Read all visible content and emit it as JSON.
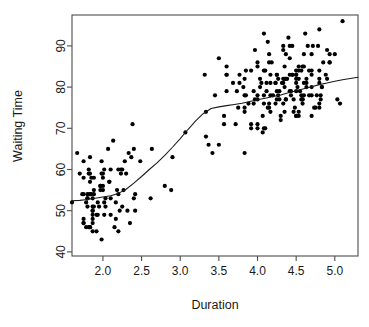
{
  "chart_data": {
    "type": "scatter",
    "title": "",
    "subtitle": "",
    "xlabel": "Duration",
    "ylabel": "Waiting Time",
    "xlim": [
      1.6,
      5.3
    ],
    "ylim": [
      39.0,
      97.5
    ],
    "xticks": [
      2.0,
      2.5,
      3.0,
      3.5,
      4.0,
      4.5,
      5.0
    ],
    "xticklabels": [
      "2.0",
      "2.5",
      "3.0",
      "3.5",
      "4.0",
      "4.5",
      "5.0"
    ],
    "yticks": [
      40,
      50,
      60,
      70,
      80,
      90
    ],
    "yticklabels": [
      "40",
      "50",
      "60",
      "70",
      "80",
      "90"
    ],
    "grid": false,
    "legend": null,
    "legend_position": "none",
    "box_frame": true,
    "point_color": "#000000",
    "point_marker": "filled-circle",
    "point_radius_px": 2.1,
    "line_color": "#1a1a1a",
    "series": [
      {
        "name": "observations",
        "type": "scatter",
        "x": [
          3.6,
          1.8,
          3.333,
          2.283,
          4.533,
          2.883,
          4.7,
          3.6,
          1.95,
          4.35,
          1.833,
          3.917,
          4.2,
          1.75,
          4.7,
          2.167,
          1.75,
          4.8,
          1.6,
          4.25,
          1.8,
          1.75,
          3.45,
          3.067,
          4.533,
          3.6,
          1.967,
          4.083,
          3.85,
          4.433,
          4.3,
          4.467,
          3.367,
          4.033,
          3.833,
          2.017,
          1.867,
          4.833,
          1.833,
          4.783,
          4.35,
          1.883,
          4.567,
          1.75,
          4.533,
          3.317,
          3.833,
          2.1,
          4.633,
          2.0,
          4.8,
          4.716,
          1.833,
          4.833,
          1.733,
          4.883,
          3.717,
          1.667,
          4.567,
          4.317,
          2.233,
          4.5,
          1.75,
          4.8,
          1.817,
          4.4,
          4.167,
          4.7,
          2.067,
          4.7,
          4.033,
          1.967,
          4.5,
          4.0,
          1.983,
          5.067,
          2.017,
          4.567,
          3.883,
          3.6,
          4.133,
          4.333,
          4.1,
          2.633,
          4.067,
          4.933,
          3.95,
          4.517,
          2.167,
          4.0,
          2.2,
          4.333,
          1.867,
          4.817,
          1.833,
          4.3,
          4.667,
          3.75,
          1.867,
          4.9,
          2.483,
          4.367,
          2.1,
          4.5,
          4.05,
          1.867,
          4.7,
          1.783,
          4.85,
          3.683,
          4.733,
          2.3,
          4.9,
          4.417,
          1.7,
          4.633,
          2.317,
          4.6,
          1.817,
          4.417,
          2.617,
          4.067,
          4.25,
          1.967,
          4.6,
          3.767,
          1.917,
          4.5,
          2.267,
          4.65,
          1.867,
          4.167,
          2.8,
          4.333,
          1.833,
          4.383,
          1.883,
          4.933,
          2.033,
          3.733,
          4.233,
          2.233,
          4.533,
          4.817,
          4.333,
          1.983,
          4.633,
          2.017,
          5.1,
          1.8,
          5.033,
          4.0,
          2.4,
          4.6,
          3.567,
          4.0,
          4.5,
          4.083,
          1.8,
          3.967,
          2.2,
          4.15,
          2.0,
          3.833,
          3.5,
          4.583,
          2.367,
          5.0,
          1.933,
          4.617,
          1.917,
          2.083,
          4.583,
          3.333,
          4.167,
          4.333,
          4.5,
          2.417,
          4.0,
          4.167,
          1.883,
          4.583,
          4.25,
          3.767,
          2.033,
          4.433,
          4.083,
          1.833,
          4.417,
          2.183,
          4.8,
          1.833,
          4.8,
          4.1,
          3.966,
          4.233,
          3.5,
          4.366,
          2.25,
          4.667,
          2.1,
          4.35,
          4.133,
          1.867,
          4.6,
          1.783,
          4.367,
          3.85,
          1.933,
          4.5,
          2.383,
          4.7,
          1.867,
          3.833,
          3.417,
          4.233,
          2.4,
          4.8,
          2.0,
          4.15,
          1.867,
          4.267,
          1.75,
          4.483,
          4.0,
          4.117,
          4.083,
          4.267,
          3.917,
          4.55,
          4.083,
          2.417,
          4.183,
          2.217,
          4.45,
          1.883,
          1.85,
          4.283,
          3.95,
          2.333,
          4.15,
          2.35,
          4.933,
          2.9,
          4.583,
          3.833,
          2.083,
          4.367,
          2.133,
          4.35,
          2.2,
          4.45,
          3.567,
          4.5,
          4.15,
          3.817,
          3.917,
          4.45,
          2.0,
          4.283,
          4.767,
          4.533,
          1.85,
          4.25,
          1.983,
          2.25,
          4.75,
          4.117,
          2.15,
          4.417,
          1.817,
          4.467
        ],
        "y": [
          79,
          54,
          74,
          62,
          85,
          55,
          88,
          85,
          51,
          85,
          54,
          84,
          78,
          47,
          83,
          52,
          62,
          84,
          52,
          79,
          51,
          47,
          78,
          69,
          74,
          83,
          55,
          76,
          78,
          79,
          73,
          77,
          66,
          80,
          74,
          52,
          48,
          80,
          59,
          90,
          80,
          58,
          84,
          58,
          73,
          83,
          64,
          53,
          82,
          59,
          75,
          90,
          54,
          80,
          54,
          83,
          71,
          64,
          77,
          81,
          59,
          84,
          48,
          82,
          60,
          92,
          78,
          78,
          65,
          73,
          82,
          56,
          79,
          71,
          62,
          76,
          60,
          78,
          76,
          83,
          75,
          82,
          70,
          65,
          73,
          88,
          76,
          80,
          48,
          86,
          60,
          90,
          50,
          78,
          63,
          72,
          84,
          75,
          51,
          82,
          62,
          88,
          49,
          83,
          81,
          47,
          84,
          52,
          86,
          81,
          75,
          59,
          89,
          79,
          59,
          81,
          50,
          85,
          59,
          87,
          53,
          69,
          77,
          56,
          88,
          81,
          45,
          82,
          55,
          90,
          45,
          83,
          56,
          89,
          46,
          82,
          51,
          86,
          53,
          79,
          81,
          60,
          82,
          77,
          76,
          59,
          80,
          49,
          96,
          53,
          77,
          77,
          65,
          81,
          71,
          70,
          81,
          93,
          53,
          89,
          45,
          86,
          58,
          78,
          66,
          76,
          63,
          88,
          52,
          93,
          49,
          57,
          77,
          68,
          81,
          81,
          73,
          50,
          85,
          74,
          55,
          77,
          83,
          83,
          51,
          78,
          84,
          46,
          83,
          55,
          81,
          57,
          76,
          84,
          77,
          81,
          87,
          77,
          51,
          78,
          60,
          82,
          91,
          53,
          78,
          46,
          77,
          84,
          49,
          83,
          71,
          80,
          49,
          75,
          64,
          76,
          53,
          94,
          55,
          76,
          50,
          82,
          54,
          75,
          78,
          79,
          78,
          78,
          70,
          79,
          70,
          54,
          86,
          50,
          90,
          54,
          54,
          77,
          79,
          64,
          75,
          47,
          86,
          63,
          85,
          82,
          57,
          82,
          67,
          74,
          54,
          83,
          73,
          73,
          88,
          80,
          71,
          83,
          56,
          79,
          78,
          84,
          58,
          83,
          43,
          60,
          75,
          81,
          46,
          90,
          46,
          74
        ]
      },
      {
        "name": "loess-smooth",
        "type": "line",
        "x": [
          1.6,
          1.7,
          1.8,
          1.9,
          2.0,
          2.1,
          2.2,
          2.3,
          2.4,
          2.5,
          2.6,
          2.7,
          2.8,
          2.9,
          3.0,
          3.1,
          3.2,
          3.3,
          3.4,
          3.5,
          3.6,
          3.7,
          3.8,
          3.9,
          4.0,
          4.1,
          4.2,
          4.3,
          4.4,
          4.5,
          4.6,
          4.7,
          4.8,
          4.9,
          5.0,
          5.1,
          5.2,
          5.3
        ],
        "y": [
          52.4,
          52.5,
          52.7,
          53.0,
          53.3,
          53.6,
          54.2,
          55.2,
          56.7,
          58.3,
          60.0,
          61.6,
          63.4,
          65.4,
          67.5,
          69.7,
          71.8,
          73.6,
          74.8,
          75.2,
          75.5,
          75.8,
          76.1,
          76.5,
          76.9,
          77.3,
          77.7,
          78.1,
          78.6,
          79.1,
          79.6,
          80.1,
          80.6,
          81.0,
          81.4,
          81.8,
          82.1,
          82.4
        ]
      }
    ]
  },
  "figure": {
    "background_color": "#ffffff",
    "frame_color": "#4d4d4d",
    "plot_left_px": 72,
    "plot_right_px": 358,
    "plot_top_px": 15,
    "plot_bottom_px": 256
  }
}
